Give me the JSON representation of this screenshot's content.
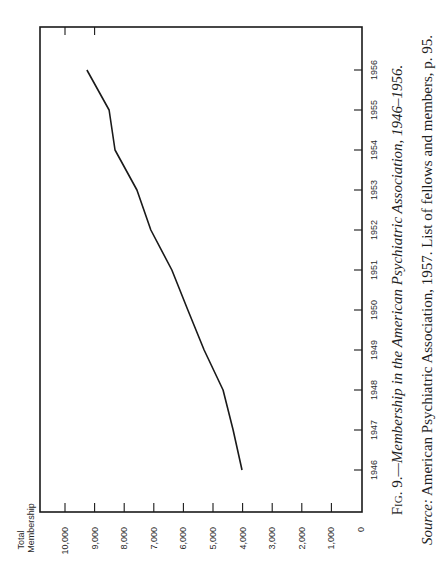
{
  "chart_data": {
    "type": "line",
    "orientation": "rotated 90deg counter-clockwise on page",
    "title": "Fig. 9.—Membership in the American Psychiatric Association, 1946–1956.",
    "source": "Source: American Psychiatric Association, 1957. List of fellows and members, p. 95.",
    "xlabel": "",
    "ylabel": "Total Membership",
    "x": [
      "1946",
      "1947",
      "1948",
      "1949",
      "1950",
      "1951",
      "1952",
      "1953",
      "1954",
      "1955",
      "1956"
    ],
    "series": [
      {
        "name": "Total Membership",
        "values": [
          4020,
          4320,
          4660,
          5300,
          5850,
          6390,
          7100,
          7570,
          8310,
          8510,
          9260
        ]
      }
    ],
    "yticks": [
      "0",
      "1,000",
      "2,000",
      "3,000",
      "4,000",
      "5,000",
      "6,000",
      "7,000",
      "8,000",
      "9,000",
      "10,000"
    ],
    "ylim": [
      0,
      10800
    ],
    "xlim": [
      "1945",
      "1957"
    ],
    "grid": false,
    "legend": null
  },
  "caption": {
    "fig_label": "Fig. 9.",
    "fig_title": "—Membership in the American Psychiatric Association, 1946–1956.",
    "source_label": "Source:",
    "source_text": " American Psychiatric Association, 1957. List of fellows and members, p. 95."
  },
  "axis": {
    "y_title_line1": "Total",
    "y_title_line2": "Membership"
  }
}
